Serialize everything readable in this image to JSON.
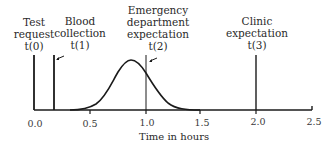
{
  "diagram": {
    "xlabel": "Time in hours",
    "ticks": [
      {
        "value": 0.0,
        "label": "0.0"
      },
      {
        "value": 0.5,
        "label": "0.5"
      },
      {
        "value": 1.0,
        "label": "1.0"
      },
      {
        "value": 1.5,
        "label": "1.5"
      },
      {
        "value": 2.0,
        "label": "2.0"
      },
      {
        "value": 2.5,
        "label": "2.5"
      }
    ],
    "markers": [
      {
        "id": "t0",
        "time": 0.0,
        "line1": "Test",
        "line2": "request",
        "line3": "t(0)"
      },
      {
        "id": "t1",
        "time": 0.18,
        "line1": "Blood",
        "line2": "collection",
        "line3": "t(1)"
      },
      {
        "id": "t2",
        "time": 1.0,
        "line1": "Emergency",
        "line2": "department",
        "line3": "expectation",
        "line4": "t(2)"
      },
      {
        "id": "t3",
        "time": 2.0,
        "line1": "Clinic",
        "line2": "expectation",
        "line3": "t(3)"
      }
    ],
    "curve": {
      "shape": "bell",
      "peak_time": 0.86,
      "start_time": 0.3,
      "end_time": 1.45
    },
    "colors": {
      "line": "#1a1a1a",
      "text": "#2a2a2a"
    }
  }
}
